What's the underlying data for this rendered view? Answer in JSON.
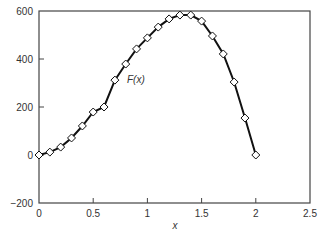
{
  "chart_data": {
    "type": "line",
    "title": "",
    "xlabel": "x",
    "ylabel": "",
    "xlim": [
      0,
      2.5
    ],
    "ylim": [
      -200,
      600
    ],
    "xticks": [
      0,
      0.5,
      1,
      1.5,
      2,
      2.5
    ],
    "xtick_labels": [
      "0",
      "0.5",
      "1",
      "1.5",
      "2",
      "2.5"
    ],
    "yticks": [
      -200,
      0,
      200,
      400,
      600
    ],
    "ytick_labels": [
      "−200",
      "0",
      "200",
      "400",
      "600"
    ],
    "grid": false,
    "legend": null,
    "annotations": [
      {
        "text": "F(x)",
        "x": 0.82,
        "y": 312
      }
    ],
    "series": [
      {
        "name": "F(x)",
        "marker": "diamond",
        "color": "#111111",
        "x": [
          0,
          0.1,
          0.2,
          0.3,
          0.4,
          0.5,
          0.6,
          0.7,
          0.8,
          0.9,
          1.0,
          1.1,
          1.2,
          1.3,
          1.4,
          1.5,
          1.6,
          1.7,
          1.8,
          1.9,
          2.0
        ],
        "y": [
          0,
          12,
          33,
          71,
          121,
          179,
          200,
          312,
          379,
          442,
          488,
          533,
          567,
          583,
          583,
          558,
          496,
          421,
          304,
          154,
          0
        ]
      }
    ]
  },
  "labels": {
    "x_axis": "x",
    "annotation": "F(x)"
  }
}
